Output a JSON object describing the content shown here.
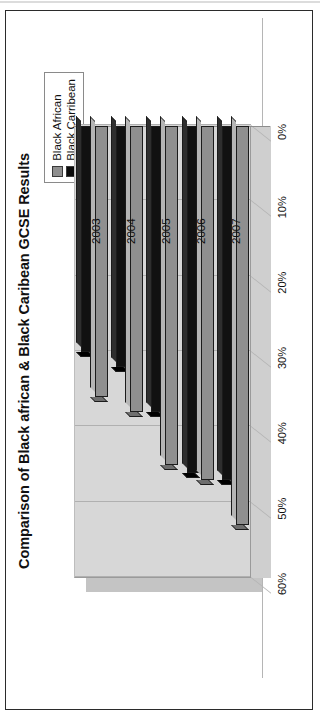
{
  "document": {
    "frame_color": "#2b2b2b",
    "background": "#ffffff"
  },
  "chart_data": {
    "type": "bar",
    "orientation": "horizontal-3d",
    "title": "Comparison of Black african & Black Caribean GCSE Results",
    "xlabel": "",
    "ylabel": "",
    "categories": [
      "2003",
      "2004",
      "2005",
      "2006",
      "2007"
    ],
    "series": [
      {
        "name": "Black African",
        "color": "#8f8f8f",
        "values": [
          36,
          38,
          45,
          47,
          53
        ]
      },
      {
        "name": "Black Carribean",
        "color": "#111111",
        "values": [
          30,
          32,
          38,
          46,
          47
        ]
      }
    ],
    "xticks": [
      "0%",
      "10%",
      "20%",
      "30%",
      "40%",
      "50%",
      "60%"
    ],
    "xlim": [
      0,
      60
    ],
    "grid": true,
    "legend_position": "top-right",
    "legend_entries": [
      "Black African",
      "Black Carribean"
    ]
  }
}
